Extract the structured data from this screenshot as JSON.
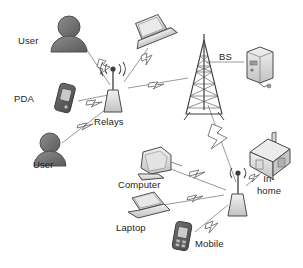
{
  "diagram": {
    "background": "#ffffff",
    "ink": "#3a3a3a",
    "label_color": "#1d1d1d",
    "link_color": "#8a8a8a",
    "icon_fill": "#d9d9d9",
    "avatar_fill": "#6e6e6e"
  },
  "labels": {
    "user_top": "User",
    "pda": "PDA",
    "relays": "Relays",
    "user_bottom": "User",
    "bs": "BS",
    "computer": "Computer",
    "laptop": "Laptop",
    "mobile": "Mobile",
    "in_home_line1": "In-",
    "in_home_line2": "home"
  },
  "nodes": [
    {
      "id": "user-top",
      "icon": "user-avatar-icon",
      "label": "User",
      "x": 62,
      "y": 40
    },
    {
      "id": "pda",
      "icon": "pda-device-icon",
      "label": "PDA",
      "x": 58,
      "y": 99
    },
    {
      "id": "user-bottom",
      "icon": "user-avatar-icon",
      "label": "User",
      "x": 50,
      "y": 155
    },
    {
      "id": "laptop-top",
      "icon": "laptop-icon",
      "label": "",
      "x": 152,
      "y": 32
    },
    {
      "id": "relay-upper",
      "icon": "relay-antenna-icon",
      "label": "Relays",
      "x": 113,
      "y": 97
    },
    {
      "id": "tower",
      "icon": "cell-tower-icon",
      "label": "",
      "x": 204,
      "y": 85
    },
    {
      "id": "bs-server",
      "icon": "server-icon",
      "label": "BS",
      "x": 255,
      "y": 62
    },
    {
      "id": "computer",
      "icon": "desktop-computer-icon",
      "label": "Computer",
      "x": 150,
      "y": 172
    },
    {
      "id": "laptop",
      "icon": "laptop-icon",
      "label": "Laptop",
      "x": 145,
      "y": 213
    },
    {
      "id": "mobile",
      "icon": "mobile-phone-icon",
      "label": "Mobile",
      "x": 190,
      "y": 238
    },
    {
      "id": "relay-lower",
      "icon": "relay-antenna-icon",
      "label": "",
      "x": 238,
      "y": 200
    },
    {
      "id": "house",
      "icon": "house-icon",
      "label": "In-home",
      "x": 268,
      "y": 163
    }
  ],
  "links": [
    {
      "from": "user-top",
      "to": "relay-upper",
      "type": "wireless-lightning"
    },
    {
      "from": "laptop-top",
      "to": "relay-upper",
      "type": "wireless-lightning"
    },
    {
      "from": "pda",
      "to": "relay-upper",
      "type": "wireless-lightning"
    },
    {
      "from": "user-bottom",
      "to": "relay-upper",
      "type": "wireless-lightning"
    },
    {
      "from": "relay-upper",
      "to": "tower",
      "type": "wireless-lightning"
    },
    {
      "from": "tower",
      "to": "bs-server",
      "type": "wired"
    },
    {
      "from": "tower",
      "to": "relay-lower",
      "type": "wireless-lightning"
    },
    {
      "from": "computer",
      "to": "relay-lower",
      "type": "wireless-lightning"
    },
    {
      "from": "laptop",
      "to": "relay-lower",
      "type": "wireless-lightning"
    },
    {
      "from": "mobile",
      "to": "relay-lower",
      "type": "wireless-lightning"
    },
    {
      "from": "relay-lower",
      "to": "house",
      "type": "wireless-lightning"
    }
  ]
}
